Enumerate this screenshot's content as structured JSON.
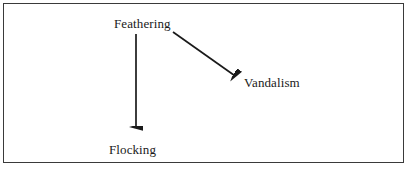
{
  "figure": {
    "border_color": "#3a3a3a",
    "background_color": "#ffffff",
    "ink_color": "#1a1a1a"
  },
  "diagram": {
    "type": "directed-graph",
    "nodes": [
      {
        "id": "feathering",
        "label": "Feathering",
        "x": 145,
        "y": 24
      },
      {
        "id": "vandalism",
        "label": "Vandalism",
        "x": 275,
        "y": 83
      },
      {
        "id": "flocking",
        "label": "Flocking",
        "x": 136,
        "y": 150
      }
    ],
    "edges": [
      {
        "id": "feathering-to-flocking",
        "from": "feathering",
        "to": "flocking",
        "label": "",
        "x1": 136,
        "y1": 34,
        "x2": 136,
        "y2": 133
      },
      {
        "id": "feathering-to-vandalism",
        "from": "feathering",
        "to": "vandalism",
        "label": "",
        "x1": 173,
        "y1": 32,
        "x2": 239,
        "y2": 79
      }
    ]
  }
}
